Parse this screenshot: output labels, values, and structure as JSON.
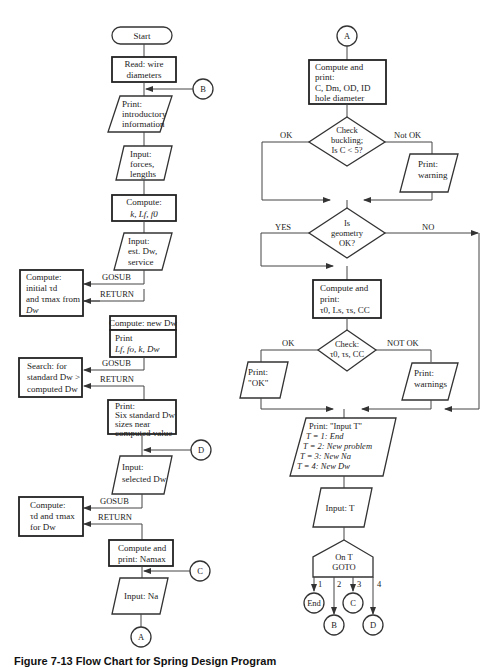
{
  "diagram": {
    "type": "flowchart",
    "left_column": {
      "start": "Start",
      "read_wire": [
        "Read: wire",
        "diameters"
      ],
      "print_intro": [
        "Print:",
        "introductory",
        "information"
      ],
      "input_forces": [
        "Input:",
        "forces,",
        "lengths"
      ],
      "compute_k": [
        "Compute:",
        "k, Lf, f0"
      ],
      "input_est": [
        "Input:",
        "est. Dw,",
        "service"
      ],
      "sub1": [
        "Compute:",
        "initial τd",
        "and τmax from",
        "Dw"
      ],
      "compute_new": "Compute: new Dw",
      "print_lf": [
        "Print",
        "Lf, fo, k, Dw"
      ],
      "sub2": [
        "Search: for",
        "standard Dw >",
        "computed Dw"
      ],
      "print_six": [
        "Print:",
        "Six standard Dw",
        "sizes near",
        "computed value"
      ],
      "input_selected": [
        "Input:",
        "selected Dw"
      ],
      "sub3": [
        "Compute:",
        "τd and τmax",
        "for Dw"
      ],
      "compute_na": [
        "Compute and",
        "print: Namax"
      ],
      "input_na": "Input: Na",
      "gosub": "GOSUB",
      "return": "RETURN"
    },
    "right_column": {
      "compute_c": [
        "Compute and",
        "print:",
        "C, Dm, OD, ID",
        "hole diameter"
      ],
      "check_buckling": [
        "Check",
        "buckling;",
        "Is C < 5?"
      ],
      "ok": "OK",
      "not_ok": "Not OK",
      "print_warning": [
        "Print:",
        "warning"
      ],
      "geometry": [
        "Is",
        "geometry",
        "OK?"
      ],
      "yes": "YES",
      "no": "NO",
      "compute_tau": [
        "Compute and",
        "print:",
        "τ0, Ls, τs, CC"
      ],
      "check_tau": [
        "Check:",
        "τ0, τs, CC"
      ],
      "ok2": "OK",
      "not_ok2": "NOT OK",
      "print_ok": [
        "Print:",
        "\"OK\""
      ],
      "print_warnings": [
        "Print:",
        "warnings"
      ],
      "print_input_t": [
        "Print: \"Input T\"",
        "T = 1: End",
        "T = 2: New problem",
        "T = 3: New Na",
        "T = 4: New Dw"
      ],
      "input_t": "Input: T",
      "on_goto": [
        "On T",
        "GOTO"
      ],
      "branches": [
        "1",
        "2",
        "3",
        "4"
      ],
      "end": "End"
    },
    "connectors": {
      "A": "A",
      "B": "B",
      "C": "C",
      "D": "D"
    },
    "caption": "Figure 7-13  Flow Chart for Spring Design Program"
  }
}
